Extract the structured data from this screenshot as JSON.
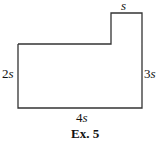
{
  "diagram": {
    "shape": "L-shaped rectangle outline",
    "labels": {
      "top": {
        "coef": "",
        "var": "s"
      },
      "left": {
        "coef": "2",
        "var": "s"
      },
      "right": {
        "coef": "3",
        "var": "s"
      },
      "bottom": {
        "coef": "4",
        "var": "s"
      }
    },
    "caption": "Ex. 5",
    "stroke_color": "#333333"
  }
}
